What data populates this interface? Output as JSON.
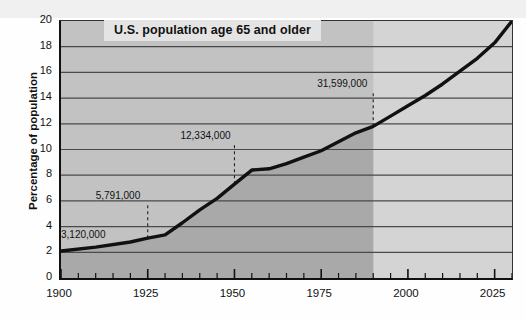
{
  "chart_data": {
    "type": "area",
    "title": "U.S. population age 65 and older",
    "xlabel": "",
    "ylabel": "Percentage of population",
    "xlim": [
      1900,
      2030
    ],
    "ylim": [
      0,
      20
    ],
    "grid": true,
    "legend": "none",
    "x_ticks": [
      1900,
      1925,
      1950,
      1975,
      2000,
      2025
    ],
    "x_minor_tick_step": 5,
    "y_ticks": [
      0,
      2,
      4,
      6,
      8,
      10,
      12,
      14,
      16,
      18,
      20
    ],
    "series": [
      {
        "name": "Percentage of population age 65 and older",
        "x": [
          1900,
          1910,
          1920,
          1925,
          1930,
          1935,
          1940,
          1945,
          1950,
          1955,
          1960,
          1965,
          1970,
          1975,
          1980,
          1985,
          1990,
          1995,
          2000,
          2005,
          2010,
          2015,
          2020,
          2025,
          2030
        ],
        "values": [
          2.1,
          2.4,
          2.8,
          3.1,
          3.35,
          4.3,
          5.3,
          6.2,
          7.3,
          8.4,
          8.5,
          8.9,
          9.4,
          9.9,
          10.6,
          11.3,
          11.8,
          12.6,
          13.4,
          14.2,
          15.1,
          16.1,
          17.1,
          18.3,
          20.0
        ]
      }
    ],
    "shaded_region": {
      "description": "darker fill under curve for historical data",
      "from": 1900,
      "to": 1990
    },
    "annotations": [
      {
        "label": "3,120,000",
        "year": 1900,
        "value": 2.1,
        "leader": false
      },
      {
        "label": "5,791,000",
        "year": 1925,
        "value": 3.1,
        "leader": true
      },
      {
        "label": "12,334,000",
        "year": 1950,
        "value": 7.3,
        "leader": true
      },
      {
        "label": "31,599,000",
        "year": 1990,
        "value": 11.8,
        "leader": true
      }
    ],
    "colors": {
      "plot_background": "#d4d4d4",
      "shaded_fill": "#a9a9a9",
      "line": "#111111",
      "gridline": "#4a4a4a",
      "axis": "#111111",
      "text": "#111111",
      "title_background": "#e4e4e4",
      "page_background": "#fefefe"
    }
  },
  "axis": {
    "y_tick_labels": [
      "20",
      "18",
      "16",
      "14",
      "12",
      "10",
      "8",
      "6",
      "4",
      "2",
      "0"
    ],
    "x_tick_labels": [
      "1900",
      "1925",
      "1950",
      "1975",
      "2000",
      "2025"
    ]
  },
  "annotation_labels": {
    "a0": "3,120,000",
    "a1": "5,791,000",
    "a2": "12,334,000",
    "a3": "31,599,000"
  },
  "title": "U.S. population age 65 and older",
  "ylabel": "Percentage of population"
}
